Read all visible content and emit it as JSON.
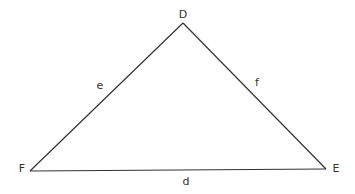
{
  "diagram": {
    "type": "triangle",
    "stroke_color": "#333333",
    "background": "#ffffff",
    "vertices": [
      {
        "id": "D",
        "label": "D",
        "x": 183,
        "y": 23,
        "label_x": 183,
        "label_y": 18
      },
      {
        "id": "F",
        "label": "F",
        "x": 30,
        "y": 171,
        "label_x": 22,
        "label_y": 172
      },
      {
        "id": "E",
        "label": "E",
        "x": 326,
        "y": 169,
        "label_x": 336,
        "label_y": 172
      }
    ],
    "sides": [
      {
        "id": "e",
        "label": "e",
        "from": "F",
        "to": "D",
        "label_x": 100,
        "label_y": 89
      },
      {
        "id": "f",
        "label": "f",
        "from": "D",
        "to": "E",
        "label_x": 257,
        "label_y": 86
      },
      {
        "id": "d",
        "label": "d",
        "from": "F",
        "to": "E",
        "label_x": 186,
        "label_y": 185
      }
    ]
  }
}
